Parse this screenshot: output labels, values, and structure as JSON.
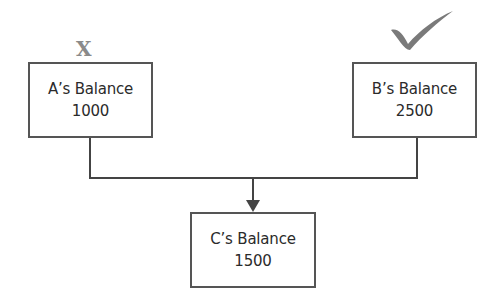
{
  "diagram": {
    "nodes": [
      {
        "id": "A",
        "label": "A’s Balance",
        "value": "1000",
        "marker": "X"
      },
      {
        "id": "B",
        "label": "B’s Balance",
        "value": "2500",
        "marker": "checkmark"
      },
      {
        "id": "C",
        "label": "C’s Balance",
        "value": "1500"
      }
    ],
    "edges": [
      {
        "from": "A",
        "to": "C"
      },
      {
        "from": "B",
        "to": "C"
      }
    ],
    "markers": {
      "a_marker": "X",
      "b_marker": "checkmark"
    },
    "colors": {
      "border": "#555555",
      "line": "#444444",
      "marker": "#8a8a8a"
    }
  }
}
